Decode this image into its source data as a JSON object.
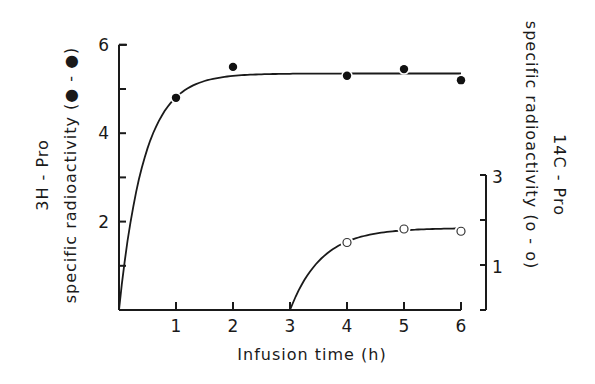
{
  "chart_data": {
    "type": "line",
    "title": "",
    "xlabel": "Infusion time (h)",
    "ylabel_left": {
      "line1": "3H - Pro",
      "line2": "specific  radioactivity (● - ●)"
    },
    "ylabel_right": {
      "line1": "14C - Pro",
      "line2": "specific  radioactivity (o - o)"
    },
    "x_ticks": [
      1,
      2,
      3,
      4,
      5,
      6
    ],
    "x_tick_labels": [
      "1",
      "2",
      "3",
      "4",
      "5",
      "6"
    ],
    "xlim": [
      0,
      6
    ],
    "y_left_ticks": [
      2,
      4,
      6
    ],
    "y_left_tick_labels": [
      "2",
      "4",
      "6"
    ],
    "y_left_minor_ticks": [
      1,
      3,
      5
    ],
    "ylim_left": [
      0,
      6
    ],
    "y_right_ticks": [
      1,
      3
    ],
    "y_right_tick_labels": [
      "1",
      "3"
    ],
    "y_right_minor_ticks": [
      2
    ],
    "ylim_right": [
      0,
      3
    ],
    "grid": false,
    "legend": "none (symbols described in axis titles)",
    "series": [
      {
        "name": "3H-Pro specific radioactivity",
        "marker": "filled-circle",
        "axis": "left",
        "x": [
          1,
          2,
          4,
          5,
          6
        ],
        "y": [
          4.8,
          5.5,
          5.3,
          5.45,
          5.2
        ],
        "fit_curve": "rises from (0,0) to plateau ~5.35 by 2 h"
      },
      {
        "name": "14C-Pro specific radioactivity",
        "marker": "open-circle",
        "axis": "right",
        "x": [
          4,
          5,
          6
        ],
        "y": [
          1.5,
          1.8,
          1.75
        ],
        "fit_curve": "rises from (3,0) to plateau ~1.8 by 5 h"
      }
    ]
  }
}
